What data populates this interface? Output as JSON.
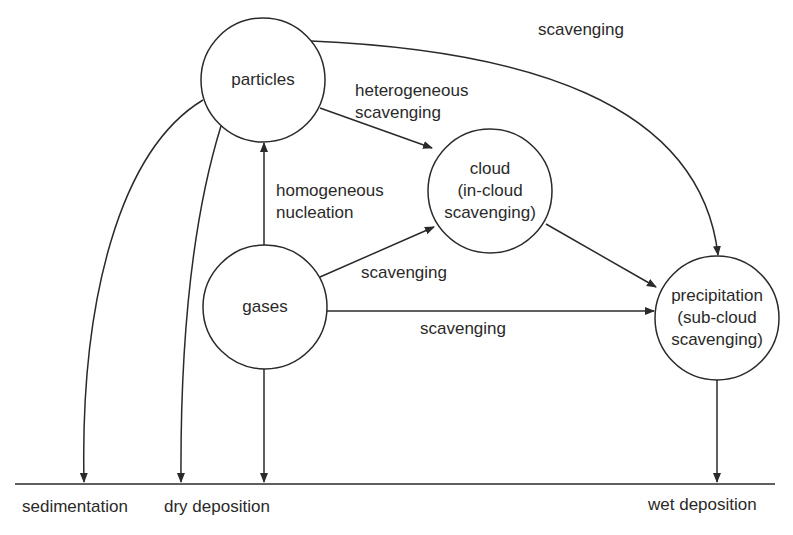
{
  "diagram": {
    "nodes": [
      {
        "id": "particles",
        "lines": [
          "particles"
        ]
      },
      {
        "id": "cloud",
        "lines": [
          "cloud",
          "(in-cloud",
          "scavenging)"
        ]
      },
      {
        "id": "gases",
        "lines": [
          "gases"
        ]
      },
      {
        "id": "precipitation",
        "lines": [
          "precipitation",
          "(sub-cloud",
          "scavenging)"
        ]
      }
    ],
    "edge_labels": {
      "particles_to_precipitation": "scavenging",
      "heterogeneous_1": "heterogeneous",
      "heterogeneous_2": "scavenging",
      "homogeneous_1": "homogeneous",
      "homogeneous_2": "nucleation",
      "gases_to_cloud": "scavenging",
      "gases_to_precipitation": "scavenging"
    },
    "ground_labels": {
      "sedimentation": "sedimentation",
      "dry_deposition": "dry deposition",
      "wet_deposition": "wet deposition"
    },
    "colors": {
      "line": "#2a2a2a",
      "background": "#ffffff"
    }
  }
}
